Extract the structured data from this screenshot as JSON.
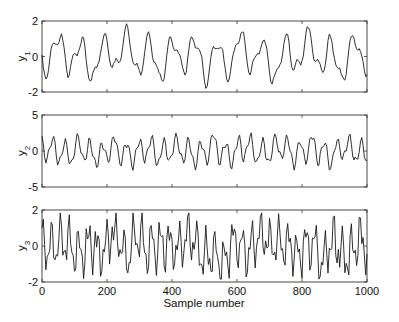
{
  "chart_data": {
    "type": "line",
    "layout": "3 stacked subplots sharing x-axis",
    "xlabel": "Sample number",
    "xlim": [
      0,
      1000
    ],
    "xticks": [
      0,
      200,
      400,
      600,
      800,
      1000
    ],
    "grid": false,
    "legend": "none",
    "panels": [
      {
        "ylabel": "y",
        "ylabel_subscript": "1",
        "ylim": [
          -2,
          2
        ],
        "yticks": [
          -2,
          0,
          2
        ],
        "series_description": "quasi-periodic oscillation, amplitude approx ±1.3, period approx 70 samples",
        "seed": 1,
        "amp": 1.0,
        "period": 70,
        "noise": 0.15,
        "harm": 0.45
      },
      {
        "ylabel": "y",
        "ylabel_subscript": "2",
        "ylim": [
          -5,
          5
        ],
        "yticks": [
          -5,
          0,
          5
        ],
        "series_description": "quasi-periodic oscillation, amplitude approx ±2.3, period approx 38 samples",
        "seed": 2,
        "amp": 1.6,
        "period": 38,
        "noise": 0.25,
        "harm": 0.4
      },
      {
        "ylabel": "y",
        "ylabel_subscript": "3",
        "ylim": [
          -2,
          2
        ],
        "yticks": [
          -2,
          0,
          2
        ],
        "series_description": "irregular oscillation, amplitude approx ±1.7, dominant period approx 28 samples",
        "seed": 3,
        "amp": 1.0,
        "period": 28,
        "noise": 0.35,
        "harm": 0.7
      }
    ]
  },
  "axes": {
    "xtick_labels": [
      "0",
      "200",
      "400",
      "600",
      "800",
      "1000"
    ],
    "xlabel": "Sample number"
  }
}
